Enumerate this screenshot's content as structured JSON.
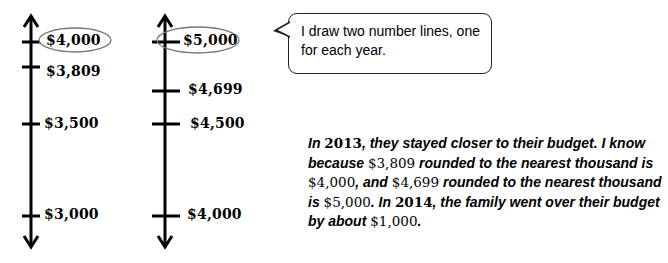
{
  "number_lines": [
    {
      "year": "2013",
      "ticks": [
        {
          "label": "$4,000",
          "circled": true
        },
        {
          "label": "$3,809",
          "circled": false
        },
        {
          "label": "$3,500",
          "circled": false
        },
        {
          "label": "$3,000",
          "circled": false
        }
      ]
    },
    {
      "year": "2014",
      "ticks": [
        {
          "label": "$5,000",
          "circled": true
        },
        {
          "label": "$4,699",
          "circled": false
        },
        {
          "label": "$4,500",
          "circled": false
        },
        {
          "label": "$4,000",
          "circled": false
        }
      ]
    }
  ],
  "speech_bubble": {
    "line1": "I draw two number lines, one",
    "line2": "for each year."
  },
  "explanation": {
    "p1_a": "In ",
    "p1_year": "2013",
    "p1_b": ", they stayed closer to their budget.  I know because ",
    "n1": "$3,809",
    "p2": " rounded to the nearest thousand is ",
    "n2": "$4,000",
    "p3": ", and ",
    "n3": "$4,699",
    "p4": " rounded to the nearest thousand is ",
    "n4": "$5,000",
    "p5": ".  In ",
    "p5_year": "2014",
    "p6": ", the family went over their budget by about ",
    "n5": "$1,000",
    "p7": "."
  }
}
